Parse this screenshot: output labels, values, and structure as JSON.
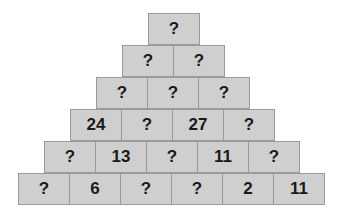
{
  "puzzle": {
    "type": "number-pyramid",
    "rows": [
      [
        "?"
      ],
      [
        "?",
        "?"
      ],
      [
        "?",
        "?",
        "?"
      ],
      [
        "24",
        "?",
        "27",
        "?"
      ],
      [
        "?",
        "13",
        "?",
        "11",
        "?"
      ],
      [
        "?",
        "6",
        "?",
        "?",
        "2",
        "11"
      ]
    ]
  },
  "colors": {
    "cell_fill": "#cfcfcf",
    "cell_border": "#9a9a9a",
    "text": "#1a1a1a",
    "background": "#ffffff"
  }
}
